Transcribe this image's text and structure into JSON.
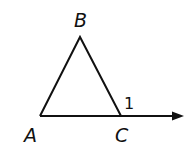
{
  "diagram": {
    "type": "triangle with exterior angle",
    "vertices": {
      "A": "A",
      "B": "B",
      "C": "C"
    },
    "angle_label": "1"
  }
}
